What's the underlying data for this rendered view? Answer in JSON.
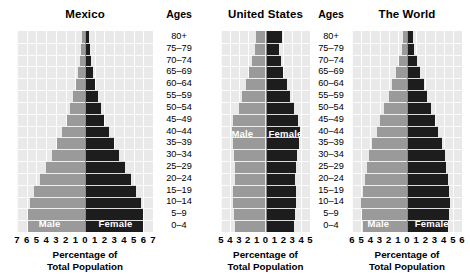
{
  "figure": {
    "xlabel_line1": "Percentage of",
    "xlabel_line2": "Total Population",
    "ages_header": "Ages",
    "legend_male": "Male",
    "legend_female": "Female",
    "male_color": "#9a9a9a",
    "female_color": "#1d1d1d",
    "plot_bg": "#e9e9e9"
  },
  "age_groups": [
    "80+",
    "75–79",
    "70–74",
    "65–69",
    "60–64",
    "55–59",
    "50–54",
    "45–49",
    "40–44",
    "35–39",
    "30–34",
    "25–29",
    "20–24",
    "15–19",
    "10–14",
    "5–9",
    "0–4"
  ],
  "chart_data": [
    {
      "type": "bar",
      "title": "Mexico",
      "orientation": "population-pyramid",
      "xlabel": "Percentage of Total Population",
      "ylabel": "Ages",
      "categories": [
        "80+",
        "75–79",
        "70–74",
        "65–69",
        "60–64",
        "55–59",
        "50–54",
        "45–49",
        "40–44",
        "35–39",
        "30–34",
        "25–29",
        "20–24",
        "15–19",
        "10–14",
        "5–9",
        "0–4"
      ],
      "xlim": [
        -7,
        7
      ],
      "xticks": [
        7,
        6,
        5,
        4,
        3,
        2,
        1,
        0,
        1,
        2,
        3,
        4,
        5,
        6,
        7
      ],
      "grid": true,
      "legend": [
        "Male",
        "Female"
      ],
      "legend_position": "inside-bottom",
      "series": [
        {
          "name": "Male",
          "values": [
            0.3,
            0.4,
            0.5,
            0.7,
            0.9,
            1.2,
            1.5,
            1.9,
            2.4,
            2.9,
            3.4,
            4.0,
            4.6,
            5.2,
            5.7,
            5.9,
            5.9
          ]
        },
        {
          "name": "Female",
          "values": [
            0.4,
            0.5,
            0.6,
            0.8,
            1.0,
            1.3,
            1.6,
            2.0,
            2.5,
            3.0,
            3.5,
            4.1,
            4.7,
            5.3,
            5.8,
            6.0,
            6.0
          ]
        }
      ]
    },
    {
      "type": "bar",
      "title": "United States",
      "orientation": "population-pyramid",
      "xlabel": "Percentage of Total Population",
      "ylabel": "Ages",
      "categories": [
        "80+",
        "75–79",
        "70–74",
        "65–69",
        "60–64",
        "55–59",
        "50–54",
        "45–49",
        "40–44",
        "35–39",
        "30–34",
        "25–29",
        "20–24",
        "15–19",
        "10–14",
        "5–9",
        "0–4"
      ],
      "xlim": [
        -5,
        5
      ],
      "xticks": [
        5,
        4,
        3,
        2,
        1,
        0,
        1,
        2,
        3,
        4,
        5
      ],
      "grid": true,
      "legend": [
        "Male",
        "Female"
      ],
      "legend_position": "inside-middle",
      "series": [
        {
          "name": "Male",
          "values": [
            1.1,
            1.2,
            1.5,
            1.8,
            2.2,
            2.6,
            3.0,
            3.6,
            3.8,
            3.7,
            3.5,
            3.4,
            3.4,
            3.6,
            3.6,
            3.5,
            3.4
          ]
        },
        {
          "name": "Female",
          "values": [
            1.8,
            1.5,
            1.7,
            2.0,
            2.4,
            2.8,
            3.2,
            3.7,
            3.9,
            3.8,
            3.5,
            3.4,
            3.3,
            3.4,
            3.4,
            3.3,
            3.2
          ]
        }
      ]
    },
    {
      "type": "bar",
      "title": "The World",
      "orientation": "population-pyramid",
      "xlabel": "Percentage of Total Population",
      "ylabel": "Ages",
      "categories": [
        "80+",
        "75–79",
        "70–74",
        "65–69",
        "60–64",
        "55–59",
        "50–54",
        "45–49",
        "40–44",
        "35–39",
        "30–34",
        "25–29",
        "20–24",
        "15–19",
        "10–14",
        "5–9",
        "0–4"
      ],
      "xlim": [
        -6,
        6
      ],
      "xticks": [
        6,
        5,
        4,
        3,
        2,
        1,
        0,
        1,
        2,
        3,
        4,
        5,
        6
      ],
      "grid": true,
      "legend": [
        "Male",
        "Female"
      ],
      "legend_position": "inside-bottom",
      "series": [
        {
          "name": "Male",
          "values": [
            0.4,
            0.6,
            0.9,
            1.2,
            1.6,
            2.0,
            2.5,
            2.9,
            3.3,
            3.8,
            4.1,
            4.4,
            4.6,
            4.8,
            5.0,
            4.9,
            4.8
          ]
        },
        {
          "name": "Female",
          "values": [
            0.6,
            0.8,
            1.1,
            1.4,
            1.8,
            2.2,
            2.6,
            3.0,
            3.4,
            3.8,
            4.1,
            4.3,
            4.5,
            4.6,
            4.7,
            4.6,
            4.5
          ]
        }
      ]
    }
  ],
  "panels": [
    {
      "left": 17,
      "width": 136,
      "ages_left": 153,
      "ages_width": 52
    },
    {
      "left": 221,
      "width": 89,
      "ages_left": 310,
      "ages_width": 42
    },
    {
      "left": 352,
      "width": 110,
      "ages_left": null,
      "ages_width": null
    }
  ]
}
